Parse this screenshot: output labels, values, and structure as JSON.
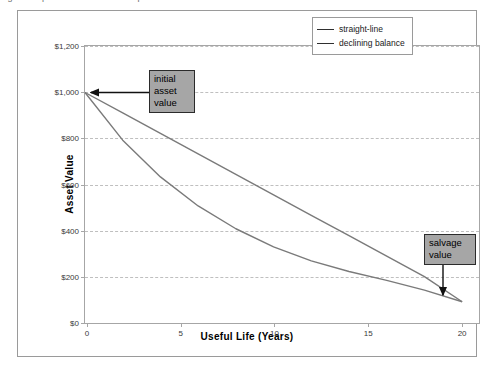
{
  "caption_remnant": "Figure: Depreciation methods comparison",
  "chart_data": {
    "type": "line",
    "title": "",
    "xlabel": "Useful Life (Years)",
    "ylabel": "Asset Value",
    "xlim": [
      0,
      21
    ],
    "ylim": [
      0,
      1200
    ],
    "xticks": [
      0,
      5,
      10,
      15,
      20
    ],
    "xticklabels": [
      "0",
      "5",
      "10",
      "15",
      "20"
    ],
    "yticks": [
      0,
      200,
      400,
      600,
      800,
      1000,
      1200
    ],
    "yticklabels": [
      "$0",
      "$200",
      "$400",
      "$600",
      "$800",
      "$1,000",
      "$1,200"
    ],
    "grid": "horizontal-dashed",
    "legend_position": "top-right",
    "series": [
      {
        "name": "straight-line",
        "x": [
          0,
          2,
          4,
          6,
          8,
          10,
          12,
          14,
          16,
          18,
          20
        ],
        "values": [
          1000,
          912,
          824,
          736,
          648,
          560,
          472,
          384,
          296,
          208,
          100
        ]
      },
      {
        "name": "declining balance",
        "x": [
          0,
          2,
          4,
          6,
          8,
          10,
          12,
          14,
          16,
          18,
          20
        ],
        "values": [
          1000,
          795,
          637,
          512,
          414,
          336,
          276,
          230,
          192,
          150,
          100
        ]
      }
    ],
    "annotations": [
      {
        "name": "initial asset value",
        "lines": [
          "initial",
          "asset",
          "value"
        ],
        "points_to_x": 0,
        "points_to_y": 1000
      },
      {
        "name": "salvage value",
        "lines": [
          "salvage",
          "value"
        ],
        "points_to_x": 20,
        "points_to_y": 100
      }
    ]
  },
  "axes": {
    "y_title": "Asset Value",
    "x_title": "Useful Life (Years)"
  },
  "legend": {
    "items": [
      {
        "label": "straight-line"
      },
      {
        "label": "declining balance"
      }
    ]
  },
  "yticklabels": {
    "t0": "$0",
    "t200": "$200",
    "t400": "$400",
    "t600": "$600",
    "t800": "$800",
    "t1000": "$1,000",
    "t1200": "$1,200"
  },
  "xticklabels": {
    "t0": "0",
    "t5": "5",
    "t10": "10",
    "t15": "15",
    "t20": "20"
  },
  "callouts": {
    "initial": {
      "line1": "initial",
      "line2": "asset",
      "line3": "value"
    },
    "salvage": {
      "line1": "salvage",
      "line2": "value"
    }
  },
  "colors": {
    "series_line": "#7a7a7a",
    "grid": "#bfbfbf",
    "axis": "#a6a6a6",
    "callout_fill": "#a6a6a6",
    "callout_border": "#2b2b2b",
    "frame": "#9a9a9a"
  }
}
